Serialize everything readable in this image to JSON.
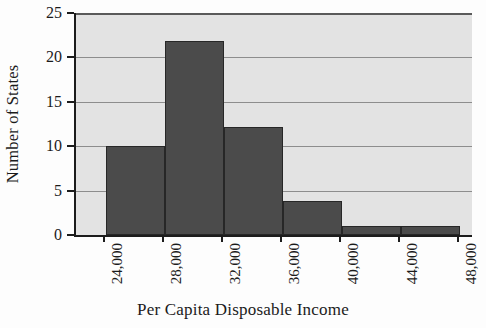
{
  "chart_data": {
    "type": "bar",
    "title": "",
    "subtitle": "",
    "xlabel": "Per Capita Disposable Income",
    "ylabel": "Number of States",
    "categories": [
      "24,000-28,000",
      "28,000-32,000",
      "32,000-36,000",
      "36,000-40,000",
      "40,000-44,000",
      "44,000-48,000"
    ],
    "bin_edges": [
      24000,
      28000,
      32000,
      36000,
      40000,
      44000,
      48000
    ],
    "values": [
      10,
      21.8,
      12.2,
      3.8,
      1,
      1
    ],
    "xlim": [
      22000,
      48800
    ],
    "ylim": [
      0,
      25
    ],
    "xticks": [
      24000,
      28000,
      32000,
      36000,
      40000,
      44000,
      48000
    ],
    "xtick_labels": [
      "24,000",
      "28,000",
      "32,000",
      "36,000",
      "40,000",
      "44,000",
      "48,000"
    ],
    "yticks": [
      0,
      5,
      10,
      15,
      20,
      25
    ],
    "ytick_labels": [
      "0",
      "5",
      "10",
      "15",
      "20",
      "25"
    ],
    "grid": true,
    "grid_axis": "y",
    "legend": false,
    "legend_position": "none",
    "bar_color": "#4b4b4b",
    "bar_edge_color": "#272727",
    "plot_background": "#e3e3e3",
    "gridline_color": "#8d8d8d",
    "axis_color": "#1c1c1c",
    "text_color": "#1b1b1b"
  }
}
